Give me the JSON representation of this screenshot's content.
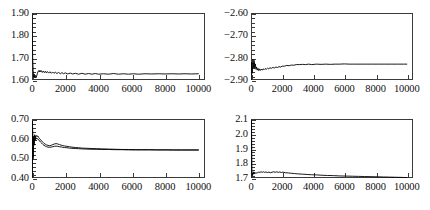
{
  "figure": {
    "layout": "2x2 grid of trace plots",
    "panel_count": 4
  },
  "chart_data": [
    {
      "id": "top-left",
      "type": "line",
      "title": "",
      "xlabel": "",
      "ylabel": "",
      "xlim": [
        0,
        10400
      ],
      "ylim": [
        1.6,
        1.9
      ],
      "grid": false,
      "legend": "none",
      "xticks": [
        0,
        2000,
        4000,
        6000,
        8000,
        10000
      ],
      "xtick_labels": [
        "0",
        "2000",
        "4000",
        "6000",
        "8000",
        "10000"
      ],
      "yticks": [
        1.6,
        1.7,
        1.8,
        1.9
      ],
      "ytick_labels": [
        "1.60",
        "1.70",
        "1.80",
        "1.90"
      ],
      "y_minor_per_interval": 4,
      "series": [
        {
          "name": "trace",
          "x": [
            0,
            40,
            70,
            100,
            130,
            160,
            200,
            240,
            280,
            320,
            360,
            400,
            440,
            480,
            520,
            560,
            620,
            680,
            740,
            800,
            860,
            920,
            1000,
            1080,
            1160,
            1240,
            1320,
            1400,
            1500,
            1600,
            1700,
            1800,
            1900,
            2000,
            2150,
            2300,
            2450,
            2600,
            2800,
            3000,
            3200,
            3400,
            3600,
            3800,
            4000,
            4300,
            4600,
            4900,
            5200,
            5500,
            5800,
            6100,
            6400,
            6800,
            7200,
            7600,
            8000,
            8400,
            8800,
            9200,
            9600,
            10000
          ],
          "y": [
            1.905,
            1.7,
            1.64,
            1.613,
            1.627,
            1.612,
            1.621,
            1.61,
            1.618,
            1.628,
            1.637,
            1.642,
            1.636,
            1.643,
            1.637,
            1.642,
            1.634,
            1.64,
            1.633,
            1.639,
            1.632,
            1.638,
            1.631,
            1.637,
            1.63,
            1.636,
            1.63,
            1.635,
            1.629,
            1.634,
            1.628,
            1.633,
            1.628,
            1.632,
            1.627,
            1.631,
            1.627,
            1.63,
            1.626,
            1.63,
            1.626,
            1.629,
            1.626,
            1.629,
            1.626,
            1.628,
            1.626,
            1.629,
            1.626,
            1.628,
            1.626,
            1.628,
            1.626,
            1.628,
            1.627,
            1.628,
            1.627,
            1.628,
            1.627,
            1.628,
            1.627,
            1.628
          ]
        }
      ]
    },
    {
      "id": "top-right",
      "type": "line",
      "title": "",
      "xlabel": "",
      "ylabel": "",
      "xlim": [
        0,
        10400
      ],
      "ylim": [
        -2.9,
        -2.6
      ],
      "grid": false,
      "legend": "none",
      "xticks": [
        0,
        2000,
        4000,
        6000,
        8000,
        10000
      ],
      "xtick_labels": [
        "0",
        "2000",
        "4000",
        "6000",
        "8000",
        "10000"
      ],
      "yticks": [
        -2.9,
        -2.8,
        -2.7,
        -2.6
      ],
      "ytick_labels": [
        "−2.90",
        "−2.80",
        "−2.70",
        "−2.60"
      ],
      "y_minor_per_interval": 4,
      "series": [
        {
          "name": "trace",
          "x": [
            0,
            40,
            80,
            120,
            160,
            200,
            240,
            280,
            320,
            360,
            400,
            450,
            500,
            550,
            600,
            660,
            720,
            780,
            840,
            900,
            980,
            1060,
            1140,
            1220,
            1300,
            1400,
            1500,
            1600,
            1700,
            1800,
            1900,
            2000,
            2150,
            2300,
            2450,
            2600,
            2750,
            2900,
            3100,
            3300,
            3500,
            3700,
            3900,
            4200,
            4500,
            4800,
            5100,
            5400,
            5700,
            6000,
            6300,
            6600,
            7000,
            7400,
            7800,
            8200,
            8600,
            9000,
            9400,
            9800,
            10000
          ],
          "y": [
            -2.905,
            -2.82,
            -2.87,
            -2.806,
            -2.845,
            -2.812,
            -2.848,
            -2.828,
            -2.852,
            -2.842,
            -2.856,
            -2.848,
            -2.858,
            -2.85,
            -2.857,
            -2.851,
            -2.856,
            -2.85,
            -2.854,
            -2.849,
            -2.852,
            -2.847,
            -2.85,
            -2.845,
            -2.848,
            -2.844,
            -2.846,
            -2.842,
            -2.844,
            -2.84,
            -2.842,
            -2.838,
            -2.838,
            -2.835,
            -2.836,
            -2.833,
            -2.834,
            -2.831,
            -2.831,
            -2.83,
            -2.831,
            -2.829,
            -2.831,
            -2.829,
            -2.83,
            -2.829,
            -2.83,
            -2.829,
            -2.829,
            -2.828,
            -2.829,
            -2.829,
            -2.829,
            -2.829,
            -2.829,
            -2.829,
            -2.829,
            -2.829,
            -2.829,
            -2.829,
            -2.829
          ]
        }
      ]
    },
    {
      "id": "bottom-left",
      "type": "line",
      "title": "",
      "xlabel": "",
      "ylabel": "",
      "xlim": [
        0,
        10400
      ],
      "ylim": [
        0.4,
        0.7
      ],
      "grid": false,
      "legend": "none",
      "xticks": [
        0,
        2000,
        4000,
        6000,
        8000,
        10000
      ],
      "xtick_labels": [
        "0",
        "2000",
        "4000",
        "6000",
        "8000",
        "10000"
      ],
      "yticks": [
        0.4,
        0.5,
        0.6,
        0.7
      ],
      "ytick_labels": [
        "0.40",
        "0.50",
        "0.60",
        "0.70"
      ],
      "y_minor_per_interval": 4,
      "series": [
        {
          "name": "trace-a",
          "x": [
            0,
            30,
            60,
            90,
            120,
            160,
            200,
            250,
            300,
            350,
            400,
            460,
            520,
            580,
            650,
            720,
            800,
            880,
            960,
            1050,
            1150,
            1250,
            1350,
            1450,
            1550,
            1650,
            1750,
            1850,
            1950,
            2100,
            2250,
            2400,
            2600,
            2800,
            3000,
            3300,
            3600,
            3900,
            4200,
            4600,
            5000,
            5400,
            5800,
            6200,
            6600,
            7000,
            7500,
            8000,
            8500,
            9000,
            9500,
            10000
          ],
          "y": [
            0.4,
            0.69,
            0.505,
            0.61,
            0.575,
            0.62,
            0.6,
            0.617,
            0.61,
            0.614,
            0.606,
            0.6,
            0.594,
            0.588,
            0.582,
            0.576,
            0.572,
            0.568,
            0.566,
            0.564,
            0.566,
            0.57,
            0.573,
            0.575,
            0.573,
            0.57,
            0.567,
            0.565,
            0.563,
            0.561,
            0.559,
            0.557,
            0.555,
            0.554,
            0.552,
            0.551,
            0.55,
            0.549,
            0.548,
            0.547,
            0.546,
            0.545,
            0.545,
            0.544,
            0.544,
            0.544,
            0.543,
            0.543,
            0.543,
            0.543,
            0.543,
            0.543
          ]
        },
        {
          "name": "trace-b",
          "x": [
            0,
            30,
            60,
            90,
            120,
            160,
            200,
            250,
            300,
            350,
            400,
            460,
            520,
            580,
            650,
            720,
            800,
            880,
            960,
            1050,
            1150,
            1250,
            1350,
            1450,
            1550,
            1650,
            1750,
            1850,
            1950,
            2100,
            2250,
            2400,
            2600,
            2800,
            3000,
            3300,
            3600,
            3900,
            4200,
            4600,
            5000,
            5400,
            5800,
            6200,
            6600,
            7000,
            7500,
            8000,
            8500,
            9000,
            9500,
            10000
          ],
          "y": [
            0.4,
            0.66,
            0.495,
            0.596,
            0.566,
            0.604,
            0.592,
            0.604,
            0.598,
            0.6,
            0.594,
            0.588,
            0.582,
            0.577,
            0.571,
            0.566,
            0.562,
            0.559,
            0.557,
            0.556,
            0.557,
            0.559,
            0.561,
            0.562,
            0.561,
            0.559,
            0.558,
            0.556,
            0.555,
            0.554,
            0.552,
            0.551,
            0.55,
            0.549,
            0.548,
            0.547,
            0.546,
            0.546,
            0.545,
            0.545,
            0.544,
            0.544,
            0.543,
            0.543,
            0.543,
            0.543,
            0.543,
            0.543,
            0.542,
            0.542,
            0.542,
            0.542
          ]
        }
      ]
    },
    {
      "id": "bottom-right",
      "type": "line",
      "title": "",
      "xlabel": "",
      "ylabel": "",
      "xlim": [
        0,
        10400
      ],
      "ylim": [
        1.7,
        2.1
      ],
      "grid": false,
      "legend": "none",
      "xticks": [
        0,
        2000,
        4000,
        6000,
        8000,
        10000
      ],
      "xtick_labels": [
        "0",
        "2000",
        "4000",
        "6000",
        "8000",
        "10000"
      ],
      "yticks": [
        1.7,
        1.8,
        1.9,
        2.0,
        2.1
      ],
      "ytick_labels": [
        "1.7",
        "1.8",
        "1.9",
        "2.0",
        "2.1"
      ],
      "y_minor_per_interval": 4,
      "series": [
        {
          "name": "trace",
          "x": [
            0,
            30,
            60,
            100,
            140,
            180,
            220,
            270,
            320,
            380,
            440,
            500,
            570,
            640,
            720,
            800,
            880,
            960,
            1050,
            1150,
            1250,
            1350,
            1450,
            1550,
            1650,
            1750,
            1850,
            1950,
            2050,
            2200,
            2400,
            2600,
            2800,
            3000,
            3300,
            3600,
            3900,
            4200,
            4500,
            4900,
            5300,
            5700,
            6100,
            6500,
            6900,
            7300,
            7700,
            8100,
            8500,
            8900,
            9300,
            9700,
            10000
          ],
          "y": [
            1.7,
            2.09,
            1.735,
            1.718,
            1.742,
            1.726,
            1.74,
            1.732,
            1.736,
            1.733,
            1.737,
            1.74,
            1.738,
            1.742,
            1.739,
            1.742,
            1.738,
            1.741,
            1.737,
            1.74,
            1.736,
            1.739,
            1.742,
            1.739,
            1.742,
            1.738,
            1.741,
            1.737,
            1.74,
            1.736,
            1.734,
            1.732,
            1.73,
            1.728,
            1.726,
            1.724,
            1.722,
            1.721,
            1.719,
            1.717,
            1.716,
            1.714,
            1.713,
            1.712,
            1.711,
            1.71,
            1.709,
            1.708,
            1.707,
            1.706,
            1.705,
            1.704,
            1.703
          ]
        }
      ]
    }
  ]
}
